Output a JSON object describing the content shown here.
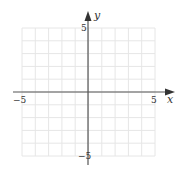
{
  "chart_data": {
    "type": "scatter",
    "title": "",
    "xlabel": "x",
    "ylabel": "y",
    "xlim": [
      -5,
      5
    ],
    "ylim": [
      -5,
      5
    ],
    "grid": true,
    "grid_step": 1,
    "x_tick_labels": [
      "-5",
      "5"
    ],
    "y_tick_labels": [
      "5",
      "-5"
    ],
    "series": []
  },
  "labels": {
    "x_axis": "x",
    "y_axis": "y",
    "x_min": "−5",
    "x_max": "5",
    "y_max": "5",
    "y_min": "−5"
  },
  "colors": {
    "grid": "#e6e6e6",
    "axis": "#444444"
  }
}
